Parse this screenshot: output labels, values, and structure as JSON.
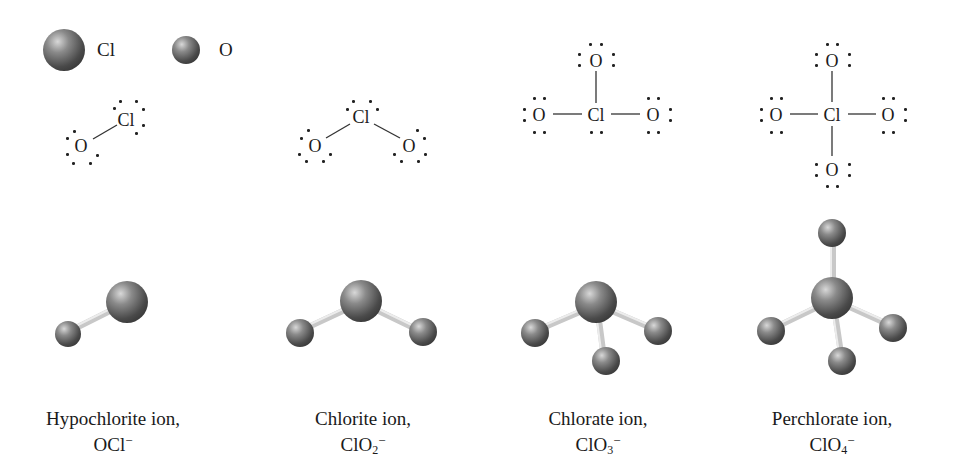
{
  "legend": {
    "items": [
      {
        "symbol": "Cl",
        "sphere": "large-gray-sphere"
      },
      {
        "symbol": "O",
        "sphere": "small-gray-sphere"
      }
    ]
  },
  "colors": {
    "sphere_dark": "#3a3a3a",
    "sphere_mid": "#7a7a7a",
    "sphere_light": "#d8d8d8",
    "bond": "#d0d0d0",
    "text": "#1a1a1a",
    "background": "#ffffff"
  },
  "ions": [
    {
      "name": "Hypochlorite ion,",
      "formula_base": "OCl",
      "formula_sub": "",
      "charge": "−",
      "lewis": {
        "central": "Cl",
        "ligands": [
          "O"
        ],
        "geometry": "linear-diagonal"
      },
      "model": {
        "central": "Cl",
        "oxygens": 1
      }
    },
    {
      "name": "Chlorite ion,",
      "formula_base": "ClO",
      "formula_sub": "2",
      "charge": "−",
      "lewis": {
        "central": "Cl",
        "ligands": [
          "O",
          "O"
        ],
        "geometry": "bent"
      },
      "model": {
        "central": "Cl",
        "oxygens": 2
      }
    },
    {
      "name": "Chlorate ion,",
      "formula_base": "ClO",
      "formula_sub": "3",
      "charge": "−",
      "lewis": {
        "central": "Cl",
        "ligands": [
          "O",
          "O",
          "O"
        ],
        "geometry": "trigonal-pyramidal"
      },
      "model": {
        "central": "Cl",
        "oxygens": 3
      }
    },
    {
      "name": "Perchlorate ion,",
      "formula_base": "ClO",
      "formula_sub": "4",
      "charge": "−",
      "lewis": {
        "central": "Cl",
        "ligands": [
          "O",
          "O",
          "O",
          "O"
        ],
        "geometry": "tetrahedral"
      },
      "model": {
        "central": "Cl",
        "oxygens": 4
      }
    }
  ]
}
